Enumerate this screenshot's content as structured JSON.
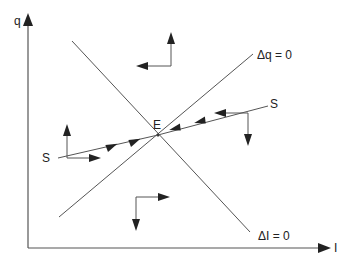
{
  "diagram": {
    "type": "phase-diagram",
    "axes": {
      "x_label": "I",
      "y_label": "q"
    },
    "loci": [
      {
        "id": "delta-q",
        "label": "Δq = 0",
        "slope": "upward"
      },
      {
        "id": "delta-i",
        "label": "ΔI = 0",
        "slope": "downward"
      }
    ],
    "equilibrium": {
      "label": "E"
    },
    "saddle_path": {
      "label_left": "S",
      "label_right": "S",
      "direction": "converges to E"
    },
    "dynamics_arrows": [
      {
        "region": "top",
        "directions": [
          "up",
          "left"
        ]
      },
      {
        "region": "bottom",
        "directions": [
          "right",
          "down"
        ]
      },
      {
        "region": "left-saddle",
        "directions": [
          "up",
          "right"
        ]
      },
      {
        "region": "right-saddle",
        "directions": [
          "left",
          "down"
        ]
      }
    ],
    "colors": {
      "ink": "#222222",
      "line": "#555555",
      "background": "#ffffff"
    }
  }
}
